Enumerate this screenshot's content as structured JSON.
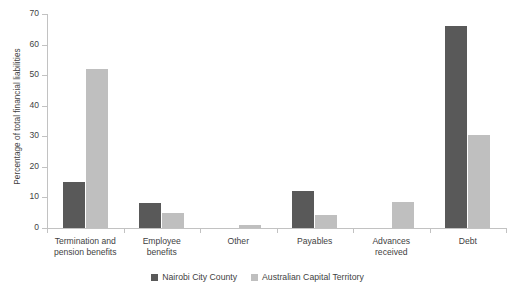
{
  "chart_data": {
    "type": "bar",
    "title": "",
    "subtitle": "",
    "xlabel": "",
    "ylabel": "Percentage of total financial liabilities",
    "ylim": [
      0,
      70
    ],
    "ytick_values": [
      0,
      10,
      20,
      30,
      40,
      50,
      60,
      70
    ],
    "ytick_labels": [
      "0",
      "10",
      "20",
      "30",
      "40",
      "50",
      "60",
      "70"
    ],
    "grid": false,
    "legend_position": "bottom-center",
    "categories": [
      "Termination and\npension benefits",
      "Employee\nbenefits",
      "Other",
      "Payables",
      "Advances\nreceived",
      "Debt"
    ],
    "series": [
      {
        "name": "Nairobi City County",
        "color": "#595959",
        "values": [
          15.2,
          8.2,
          0,
          12.0,
          0,
          66.2
        ]
      },
      {
        "name": "Australian Capital Territory",
        "color": "#bfbfbf",
        "values": [
          52.1,
          5.0,
          1.0,
          4.1,
          8.5,
          30.5
        ]
      }
    ]
  },
  "legend": {
    "items": [
      {
        "label": "Nairobi City County",
        "color": "#595959"
      },
      {
        "label": "Australian Capital Territory",
        "color": "#bfbfbf"
      }
    ]
  },
  "axes": {
    "y_title": "Percentage of total financial liabilities"
  }
}
